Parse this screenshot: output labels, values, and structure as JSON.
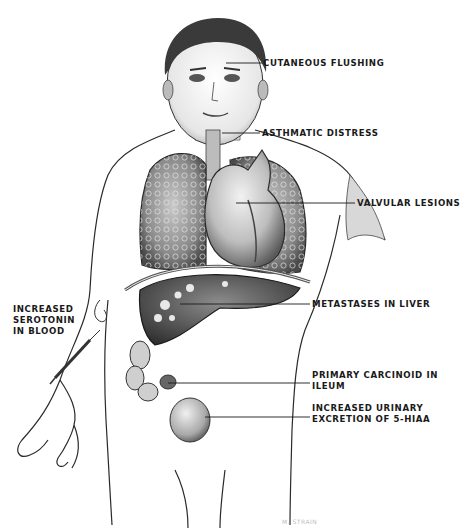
{
  "figure": {
    "colors": {
      "background": "#ffffff",
      "ink": "#1a1a1a",
      "shade_dark": "#3a3a3a",
      "shade_mid": "#7a7a7a",
      "shade_light": "#c8c8c8"
    }
  },
  "labels": {
    "cutaneous_flushing": "CUTANEOUS FLUSHING",
    "asthmatic_distress": "ASTHMATIC DISTRESS",
    "valvular_lesions": "VALVULAR LESIONS",
    "metastases_liver": "METASTASES IN LIVER",
    "serotonin": {
      "line1": "INCREASED",
      "line2": "SEROTONIN",
      "line3": "IN BLOOD"
    },
    "primary_carcinoid": {
      "line1": "PRIMARY CARCINOID IN",
      "line2": "ILEUM"
    },
    "urinary_excretion": {
      "line1": "INCREASED URINARY",
      "line2": "EXCRETION OF 5-HIAA"
    }
  },
  "signature": "M. STRAIN"
}
